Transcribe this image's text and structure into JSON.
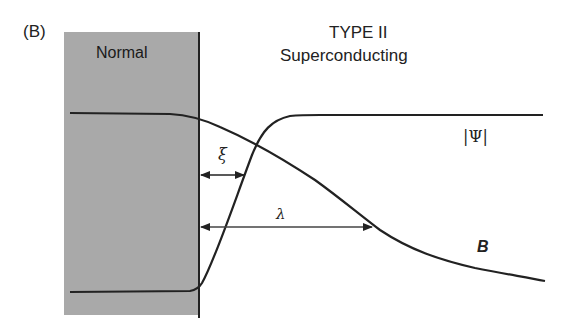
{
  "panel_label": "(B)",
  "regions": {
    "normal": {
      "label": "Normal",
      "fill": "#a9a9a9"
    },
    "superconducting": {
      "title_line1": "TYPE II",
      "title_line2": "Superconducting"
    }
  },
  "curves": {
    "order_parameter": {
      "label": "|Ψ|",
      "description": "rises from zero at the interface to a plateau within ξ"
    },
    "magnetic_field": {
      "label": "B",
      "description": "decays from the normal-region value over λ"
    }
  },
  "lengths": {
    "coherence_length": {
      "label": "ξ"
    },
    "penetration_depth": {
      "label": "λ"
    }
  }
}
